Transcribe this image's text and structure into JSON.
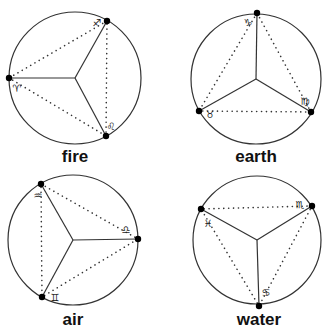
{
  "diagrams": [
    {
      "element": "fire",
      "center": [
        75,
        78
      ],
      "radius": 66,
      "points": [
        {
          "sign": "Sagittarius",
          "glyph": "♐",
          "xy": [
            107,
            21
          ],
          "label_xy": [
            97,
            26
          ]
        },
        {
          "sign": "Aries",
          "glyph": "♈",
          "xy": [
            9,
            78
          ],
          "label_xy": [
            17,
            92
          ]
        },
        {
          "sign": "Leo",
          "glyph": "♌",
          "xy": [
            106,
            136
          ],
          "label_xy": [
            111,
            130
          ]
        }
      ],
      "label_xy": [
        75,
        162
      ]
    },
    {
      "element": "earth",
      "center": [
        256,
        79
      ],
      "radius": 65,
      "points": [
        {
          "sign": "Capricorn",
          "glyph": "♑",
          "xy": [
            257,
            13
          ],
          "label_xy": [
            248,
            26
          ]
        },
        {
          "sign": "Taurus",
          "glyph": "♉",
          "xy": [
            199,
            111
          ],
          "label_xy": [
            210,
            118
          ]
        },
        {
          "sign": "Virgo",
          "glyph": "♍",
          "xy": [
            311,
            112
          ],
          "label_xy": [
            305,
            105
          ]
        }
      ],
      "label_xy": [
        256,
        162
      ]
    },
    {
      "element": "air",
      "center": [
        73,
        240
      ],
      "radius": 65,
      "points": [
        {
          "sign": "Aquarius",
          "glyph": "♒",
          "xy": [
            41,
            184
          ],
          "label_xy": [
            38,
            199
          ]
        },
        {
          "sign": "Libra",
          "glyph": "♎",
          "xy": [
            138,
            239
          ],
          "label_xy": [
            126,
            233
          ]
        },
        {
          "sign": "Gemini",
          "glyph": "♊",
          "xy": [
            42,
            297
          ],
          "label_xy": [
            55,
            301
          ]
        }
      ],
      "label_xy": [
        73,
        325
      ]
    },
    {
      "element": "water",
      "center": [
        257,
        240
      ],
      "radius": 64,
      "points": [
        {
          "sign": "Scorpio",
          "glyph": "♏",
          "xy": [
            312,
            206
          ],
          "label_xy": [
            300,
            208
          ]
        },
        {
          "sign": "Pisces",
          "glyph": "♓",
          "xy": [
            201,
            209
          ],
          "label_xy": [
            208,
            227
          ]
        },
        {
          "sign": "Cancer",
          "glyph": "♋",
          "xy": [
            259,
            306
          ],
          "label_xy": [
            266,
            296
          ]
        }
      ],
      "label_xy": [
        259,
        325
      ]
    }
  ]
}
